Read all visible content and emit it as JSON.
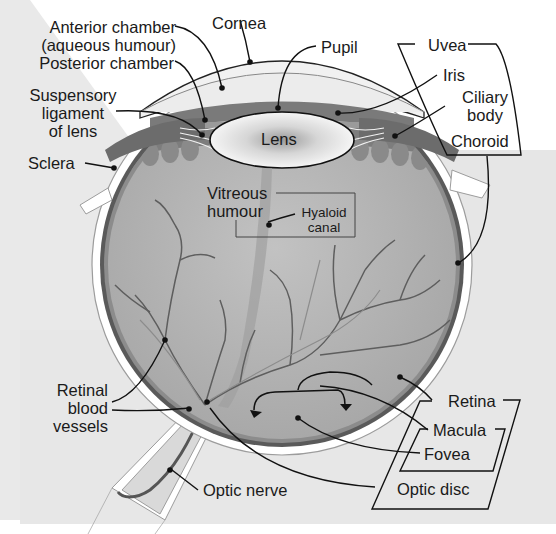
{
  "diagram": {
    "colors": {
      "background_left": "#e9e9e9",
      "background_right": "#e6e6e6",
      "sclera": "#ffffff",
      "choroid": "#5a5a5a",
      "retina": "#8c8c8c",
      "vitreous": "#b4b4b4",
      "iris": "#7a7a7a",
      "lens": "#f2f2f2",
      "vessel": "#5e5e5e",
      "leader_line": "#111111"
    },
    "labels": {
      "anterior_chamber_1": "Anterior chamber",
      "anterior_chamber_2": "(aqueous humour)",
      "posterior_chamber": "Posterior chamber",
      "suspensory_1": "Suspensory",
      "suspensory_2": "ligament",
      "suspensory_3": "of lens",
      "sclera": "Sclera",
      "cornea": "Cornea",
      "pupil": "Pupil",
      "uvea": "Uvea",
      "iris": "Iris",
      "ciliary_1": "Ciliary",
      "ciliary_2": "body",
      "choroid": "Choroid",
      "lens": "Lens",
      "vitreous_1": "Vitreous",
      "vitreous_2": "humour",
      "hyaloid_1": "Hyaloid",
      "hyaloid_2": "canal",
      "retinal_vessels_1": "Retinal",
      "retinal_vessels_2": "blood",
      "retinal_vessels_3": "vessels",
      "retina": "Retina",
      "macula": "Macula",
      "fovea": "Fovea",
      "optic_disc": "Optic disc",
      "optic_nerve": "Optic nerve"
    }
  }
}
